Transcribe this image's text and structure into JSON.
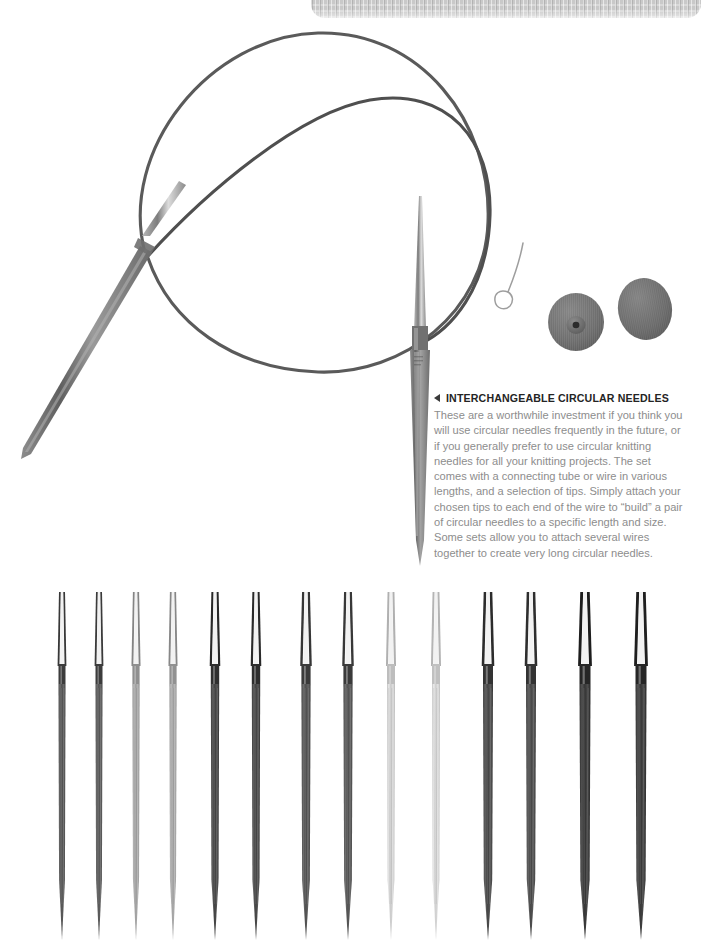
{
  "page": {
    "background_color": "#ffffff",
    "width": 701,
    "height": 948
  },
  "top_banner": {
    "name": "knit-texture-banner",
    "color": "#c9c9c9",
    "style": "knitted fabric swatch strip, rounded bottom corners"
  },
  "caption": {
    "arrow": "left-pointing-triangle",
    "heading": "INTERCHANGEABLE CIRCULAR NEEDLES",
    "heading_color": "#242424",
    "body": "These are a worthwhile investment if you think you will use circular needles frequently in the future, or if you generally prefer to use circular knitting needles for all your knitting projects. The set comes with a connecting tube or wire in various lengths, and a selection of tips. Simply attach your chosen tips to each end of the wire to “build” a pair of circular needles to a specific length and size. Some sets allow you to attach several wires together to create very long circular needles.",
    "body_color": "#8d8d8d"
  },
  "photo": {
    "name": "circular-knitting-needle-photo",
    "cable_color": "#545454",
    "needle_color": "#7a7a7a",
    "objects": [
      {
        "name": "circular-needle-assembly",
        "description": "Two overlapping loops of flexible cable joined to two tapered metal needle tips"
      },
      {
        "name": "cable-key-wire-tool",
        "description": "Thin wire threader with a small loop at one end",
        "color": "#a8a8a8"
      },
      {
        "name": "end-cap-disc-with-hub",
        "description": "Gray rubber end-cap disc, raised central hub with hole",
        "color": "#6e6e6e"
      },
      {
        "name": "end-cap-disc-plain",
        "description": "Gray rubber end-cap disc, plain face, tilted",
        "color": "#6a6a6a"
      }
    ]
  },
  "tips_row": {
    "name": "interchangeable-needle-tips-row",
    "count": 14,
    "description": "Fourteen interchangeable needle tips shown point-down in seven graduated pairs",
    "tips": [
      {
        "x": 62,
        "shaft_width": 7.0,
        "color": "#5a5a5a",
        "collar_color": "#3c3c3c"
      },
      {
        "x": 99,
        "shaft_width": 7.0,
        "color": "#5d5d5d",
        "collar_color": "#3c3c3c"
      },
      {
        "x": 136,
        "shaft_width": 7.2,
        "color": "#a6a6a6",
        "collar_color": "#8f8f8f"
      },
      {
        "x": 173,
        "shaft_width": 7.2,
        "color": "#a9a9a9",
        "collar_color": "#919191"
      },
      {
        "x": 215,
        "shaft_width": 8.4,
        "color": "#4a4a4a",
        "collar_color": "#2e2e2e"
      },
      {
        "x": 256,
        "shaft_width": 8.4,
        "color": "#4c4c4c",
        "collar_color": "#2e2e2e"
      },
      {
        "x": 306,
        "shaft_width": 9.2,
        "color": "#585858",
        "collar_color": "#3a3a3a"
      },
      {
        "x": 348,
        "shaft_width": 9.2,
        "color": "#5a5a5a",
        "collar_color": "#3a3a3a"
      },
      {
        "x": 391,
        "shaft_width": 8.0,
        "color": "#d2d2d2",
        "collar_color": "#bdbdbd"
      },
      {
        "x": 436,
        "shaft_width": 8.0,
        "color": "#d6d6d6",
        "collar_color": "#c0c0c0"
      },
      {
        "x": 488,
        "shaft_width": 10.0,
        "color": "#4e4e4e",
        "collar_color": "#333333"
      },
      {
        "x": 531,
        "shaft_width": 10.0,
        "color": "#505050",
        "collar_color": "#333333"
      },
      {
        "x": 585,
        "shaft_width": 11.0,
        "color": "#3f3f3f",
        "collar_color": "#262626"
      },
      {
        "x": 641,
        "shaft_width": 11.0,
        "color": "#414141",
        "collar_color": "#262626"
      }
    ]
  }
}
